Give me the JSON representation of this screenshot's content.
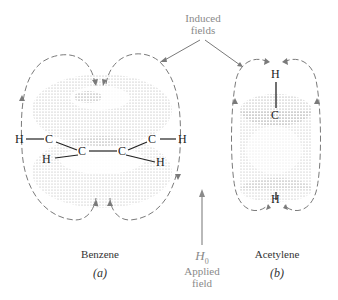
{
  "diagram": {
    "induced_label_line1": "Induced",
    "induced_label_line2": "fields",
    "applied_symbol": "H",
    "applied_subscript": "0",
    "applied_label_line1": "Applied",
    "applied_label_line2": "field",
    "panels": [
      {
        "name": "Benzene",
        "tag": "(a)",
        "atoms": {
          "h_left": "H",
          "c_left": "C",
          "c_right": "C",
          "h_right": "H",
          "h_low_left": "H",
          "c_low_left": "C",
          "c_low_right": "C",
          "h_low_right": "H"
        }
      },
      {
        "name": "Acetylene",
        "tag": "(b)",
        "atoms": {
          "h_top": "H",
          "c_mid": "C",
          "h_bottom": "H"
        }
      }
    ],
    "colors": {
      "field_line": "#7a7a7a",
      "stipple": "#6a6a6a",
      "text": "#333333",
      "applied": "#8a8a8a"
    }
  }
}
